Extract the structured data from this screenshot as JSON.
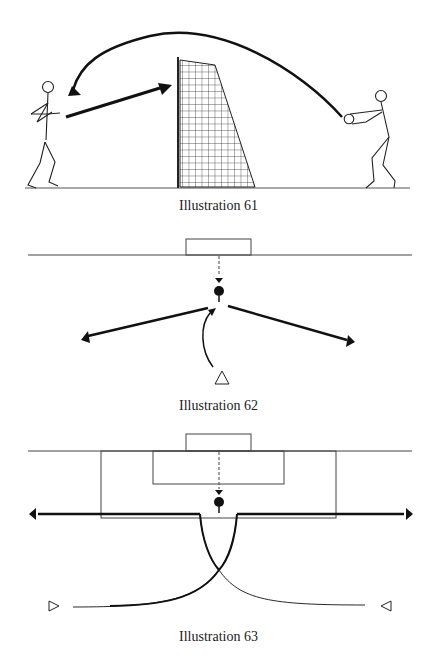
{
  "illustrations": [
    {
      "id": 61,
      "caption": "Illustration 61",
      "description": "Player heads ball over net; partner returns ball with header"
    },
    {
      "id": 62,
      "caption": "Illustration 62",
      "description": "Ball fed from goal; player runs in and passes left or right"
    },
    {
      "id": 63,
      "caption": "Illustration 63",
      "description": "Two players cross paths in front of penalty area; ball played wide left or right"
    }
  ],
  "colors": {
    "ink": "#1a1a1a",
    "line": "#333333",
    "background": "#ffffff"
  }
}
